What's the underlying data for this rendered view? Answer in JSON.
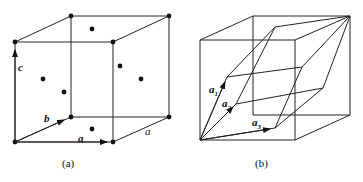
{
  "figure_a": {
    "caption": "(a)",
    "vectors": {
      "a": "a",
      "b": "b",
      "c": "c"
    },
    "edge_label": "a",
    "lattice": "face-centered cubic"
  },
  "figure_b": {
    "caption": "(b)",
    "vectors": {
      "a1": "a",
      "a1_sub": "1",
      "a2": "a",
      "a2_sub": "2",
      "a3": "a",
      "a3_sub": "3"
    },
    "cell": "primitive rhombohedral cell inside cube"
  },
  "colors": {
    "line": "#222222",
    "background": "#ffffff"
  }
}
